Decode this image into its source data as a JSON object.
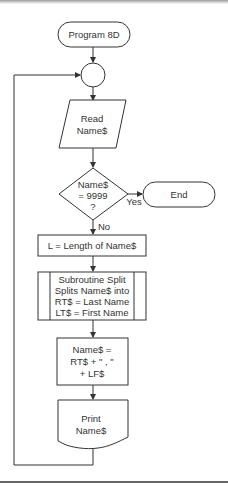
{
  "diagram": {
    "type": "flowchart",
    "nodes": {
      "start": {
        "shape": "terminal",
        "label": "Program 8D"
      },
      "connector": {
        "shape": "circle",
        "label": ""
      },
      "read": {
        "shape": "parallelogram",
        "lines": [
          "Read",
          "Name$"
        ]
      },
      "decision": {
        "shape": "diamond",
        "lines": [
          "Name$",
          "= 9999",
          "?"
        ]
      },
      "end": {
        "shape": "terminal",
        "label": "End"
      },
      "length": {
        "shape": "process",
        "label": "L = Length of Name$"
      },
      "subroutine": {
        "shape": "predefined-process",
        "lines": [
          "Subroutine Split",
          "Splits Name$ into",
          "RT$ = Last Name",
          "LT$ = First Name"
        ]
      },
      "assign": {
        "shape": "process",
        "lines": [
          "Name$ =",
          "RT$ + \" , \"",
          "+ LF$"
        ]
      },
      "print": {
        "shape": "document",
        "lines": [
          "Print",
          "Name$"
        ]
      }
    },
    "edges": {
      "yes_label": "Yes",
      "no_label": "No"
    },
    "colors": {
      "stroke": "#333333",
      "text": "#333333",
      "background": "#ffffff"
    }
  }
}
